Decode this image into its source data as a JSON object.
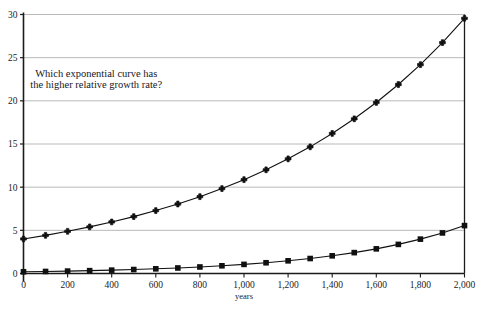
{
  "chart_data": {
    "type": "line",
    "title": "",
    "subtitle": "",
    "xlabel": "years",
    "ylabel": "",
    "xlim": [
      0,
      2000
    ],
    "ylim": [
      0,
      30
    ],
    "grid": true,
    "grid_axis": "y",
    "legend": false,
    "legend_position": "none",
    "annotations": [
      {
        "name": "question-annotation",
        "lines": [
          "Which exponential curve has",
          "the higher relative growth rate?"
        ],
        "x": 330,
        "y": 22.8
      }
    ],
    "xticks": [
      0,
      200,
      400,
      600,
      800,
      1000,
      1200,
      1400,
      1600,
      1800,
      2000
    ],
    "xtick_labels": [
      "0",
      "200",
      "400",
      "600",
      "800",
      "1,000",
      "1,200",
      "1,400",
      "1,600",
      "1,800",
      "2,000"
    ],
    "yticks": [
      0,
      5,
      10,
      15,
      20,
      25,
      30
    ],
    "ytick_labels": [
      "0",
      "5",
      "10",
      "15",
      "20",
      "25",
      "30"
    ],
    "x": [
      0,
      100,
      200,
      300,
      400,
      500,
      600,
      700,
      800,
      900,
      1000,
      1100,
      1200,
      1300,
      1400,
      1500,
      1600,
      1700,
      1800,
      1900,
      2000
    ],
    "series": [
      {
        "name": "upper-curve",
        "marker": "plus",
        "color": "#101010",
        "values": [
          4.0,
          4.42,
          4.89,
          5.4,
          5.97,
          6.59,
          7.29,
          8.05,
          8.9,
          9.84,
          10.87,
          12.01,
          13.28,
          14.67,
          16.22,
          17.92,
          19.81,
          21.89,
          24.19,
          26.74,
          29.56
        ]
      },
      {
        "name": "lower-curve",
        "marker": "square",
        "color": "#101010",
        "values": [
          0.2,
          0.236,
          0.279,
          0.329,
          0.389,
          0.459,
          0.542,
          0.64,
          0.756,
          0.893,
          1.054,
          1.244,
          1.469,
          1.735,
          2.048,
          2.418,
          2.855,
          3.371,
          3.98,
          4.699,
          5.548
        ]
      }
    ],
    "colors": {
      "axis": "#1b1b1b",
      "grid": "#b9b9b9",
      "line": "#101010",
      "background": "#ffffff",
      "text": "#1b1b1b"
    }
  }
}
